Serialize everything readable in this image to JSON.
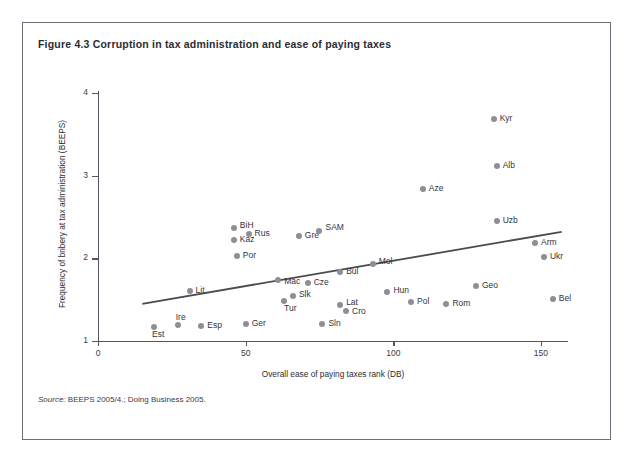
{
  "figure": {
    "title": "Figure 4.3  Corruption in tax administration and ease of paying taxes",
    "source_lead": "Source:",
    "source_text": " BEEPS 2005/4.; Doing Business 2005."
  },
  "colors": {
    "frame_border": "#6e6e78",
    "axis": "#55555f",
    "point": "#8e8e96",
    "trend_line": "#4a4a52",
    "text": "#2b2b33"
  },
  "chart_data": {
    "type": "scatter",
    "title": "Corruption in tax administration and ease of paying taxes",
    "xlabel": "Overall ease of paying taxes rank (DB)",
    "ylabel": "Frequency of bribery at tax administration (BEEPS)",
    "xlim": [
      0,
      158
    ],
    "ylim": [
      0.85,
      4.1
    ],
    "xticks": [
      0,
      50,
      100,
      150
    ],
    "yticks": [
      1,
      2,
      3,
      4
    ],
    "grid": false,
    "legend": null,
    "trend_line": {
      "label": "linear fit",
      "x_start": 15,
      "y_start": 1.45,
      "x_end": 157,
      "y_end": 2.32
    },
    "points": [
      {
        "label": "Est",
        "x": 19,
        "y": 1.17,
        "label_dx": -2,
        "label_dy": 11
      },
      {
        "label": "Ire",
        "x": 27,
        "y": 1.19,
        "label_dx": -2,
        "label_dy": -4
      },
      {
        "label": "Esp",
        "x": 35,
        "y": 1.18,
        "label_dx": 6,
        "label_dy": 3
      },
      {
        "label": "Lit",
        "x": 31,
        "y": 1.6,
        "label_dx": 6,
        "label_dy": 3
      },
      {
        "label": "BiH",
        "x": 46,
        "y": 2.37,
        "label_dx": 6,
        "label_dy": 1
      },
      {
        "label": "Kaz",
        "x": 46,
        "y": 2.22,
        "label_dx": 6,
        "label_dy": 3
      },
      {
        "label": "Rus",
        "x": 51,
        "y": 2.29,
        "label_dx": 6,
        "label_dy": 3
      },
      {
        "label": "Por",
        "x": 47,
        "y": 2.03,
        "label_dx": 6,
        "label_dy": 3
      },
      {
        "label": "Ger",
        "x": 50,
        "y": 1.21,
        "label_dx": 6,
        "label_dy": 3
      },
      {
        "label": "Mac",
        "x": 61,
        "y": 1.74,
        "label_dx": 6,
        "label_dy": 5
      },
      {
        "label": "Tur",
        "x": 63,
        "y": 1.48,
        "label_dx": 0,
        "label_dy": 11
      },
      {
        "label": "Slk",
        "x": 66,
        "y": 1.54,
        "label_dx": 6,
        "label_dy": 2
      },
      {
        "label": "Gre",
        "x": 68,
        "y": 2.27,
        "label_dx": 6,
        "label_dy": 3
      },
      {
        "label": "Cze",
        "x": 71,
        "y": 1.7,
        "label_dx": 6,
        "label_dy": 3
      },
      {
        "label": "SAM",
        "x": 75,
        "y": 2.33,
        "label_dx": 6,
        "label_dy": 0
      },
      {
        "label": "Sln",
        "x": 76,
        "y": 1.21,
        "label_dx": 6,
        "label_dy": 3
      },
      {
        "label": "Lat",
        "x": 82,
        "y": 1.44,
        "label_dx": 6,
        "label_dy": 1
      },
      {
        "label": "Cro",
        "x": 84,
        "y": 1.36,
        "label_dx": 6,
        "label_dy": 4
      },
      {
        "label": "Bul",
        "x": 82,
        "y": 1.83,
        "label_dx": 6,
        "label_dy": 3
      },
      {
        "label": "Mol",
        "x": 93,
        "y": 1.93,
        "label_dx": 6,
        "label_dy": 1
      },
      {
        "label": "Hun",
        "x": 98,
        "y": 1.59,
        "label_dx": 6,
        "label_dy": 2
      },
      {
        "label": "Pol",
        "x": 106,
        "y": 1.47,
        "label_dx": 6,
        "label_dy": 3
      },
      {
        "label": "Aze",
        "x": 110,
        "y": 2.84,
        "label_dx": 6,
        "label_dy": 3
      },
      {
        "label": "Rom",
        "x": 118,
        "y": 1.45,
        "label_dx": 6,
        "label_dy": 3
      },
      {
        "label": "Geo",
        "x": 128,
        "y": 1.66,
        "label_dx": 6,
        "label_dy": 3
      },
      {
        "label": "Kyr",
        "x": 134,
        "y": 3.68,
        "label_dx": 6,
        "label_dy": 3
      },
      {
        "label": "Alb",
        "x": 135,
        "y": 3.12,
        "label_dx": 6,
        "label_dy": 3
      },
      {
        "label": "Uzb",
        "x": 135,
        "y": 2.45,
        "label_dx": 6,
        "label_dy": 3
      },
      {
        "label": "Arm",
        "x": 148,
        "y": 2.18,
        "label_dx": 6,
        "label_dy": 3
      },
      {
        "label": "Ukr",
        "x": 151,
        "y": 2.01,
        "label_dx": 6,
        "label_dy": 3
      },
      {
        "label": "Bel",
        "x": 154,
        "y": 1.51,
        "label_dx": 6,
        "label_dy": 3
      }
    ]
  }
}
